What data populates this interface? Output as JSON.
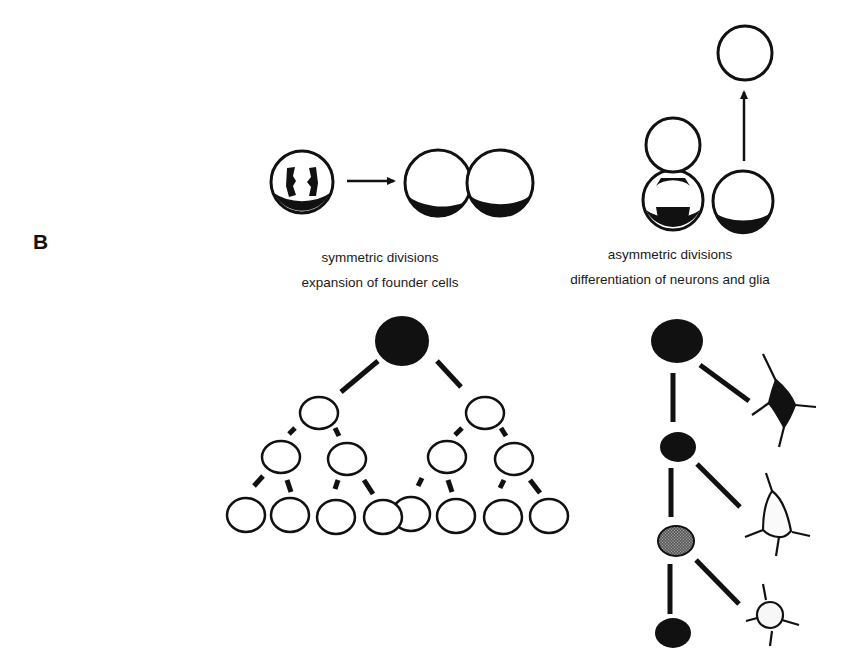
{
  "panel_label": "B",
  "symmetric": {
    "title": "symmetric divisions",
    "subtitle": "expansion of founder cells",
    "tree_levels": [
      1,
      2,
      4,
      8
    ]
  },
  "asymmetric": {
    "title": "asymmetric divisions",
    "subtitle": "differentiation of neurons and glia",
    "lineage": [
      {
        "progenitor": "filled",
        "progeny": "dark-neuron"
      },
      {
        "progenitor": "filled",
        "progeny": "open-neuron"
      },
      {
        "progenitor": "stippled",
        "progeny": "glial-cell"
      },
      {
        "progenitor": "filled",
        "progeny": null
      }
    ]
  },
  "colors": {
    "ink": "#111111",
    "paper": "#ffffff",
    "stipple": "#7a7a7a"
  }
}
